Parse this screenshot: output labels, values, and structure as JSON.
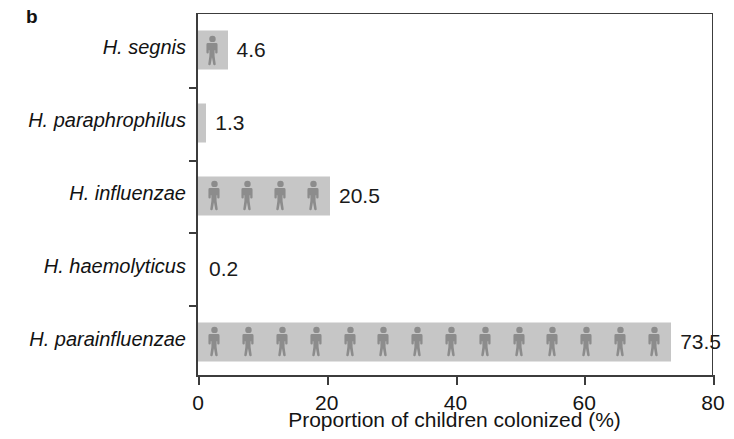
{
  "panel": {
    "letter": "b"
  },
  "chart_data": {
    "type": "bar",
    "orientation": "horizontal",
    "title": "",
    "subtitle": "",
    "xlabel": "Proportion of children colonized (%)",
    "ylabel": "",
    "xlim": [
      0,
      80
    ],
    "xticks": [
      0,
      20,
      40,
      60,
      80
    ],
    "xticklabels": [
      "0",
      "20",
      "40",
      "60",
      "80"
    ],
    "grid": false,
    "legend": null,
    "categories": [
      "H. segnis",
      "H. paraphrophilus",
      "H. influenzae",
      "H. haemolyticus",
      "H. parainfluenzae"
    ],
    "values": [
      4.6,
      1.3,
      20.5,
      0.2,
      73.5
    ],
    "datalabels": [
      "4.6",
      "1.3",
      "20.5",
      "0.2",
      "73.5"
    ],
    "bar_color": "#c6c6c6",
    "pictogram_color": "#8c8c8c",
    "pictograms_per_bar": [
      1,
      0,
      4,
      0,
      14
    ],
    "axis_color": "#3c3c3c",
    "text_color": "#141414"
  }
}
